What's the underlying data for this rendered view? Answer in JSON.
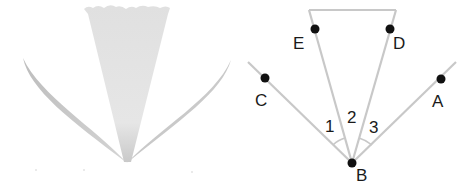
{
  "figure": {
    "left_illustration": {
      "description": "fan of three shaded leaf/cone shapes meeting at a point",
      "colors": {
        "cone": "#d9d9d9",
        "leaf": "#c4c4c4"
      }
    },
    "right_diagram": {
      "points": [
        {
          "name": "E",
          "label": "E"
        },
        {
          "name": "D",
          "label": "D"
        },
        {
          "name": "C",
          "label": "C"
        },
        {
          "name": "A",
          "label": "A"
        },
        {
          "name": "B",
          "label": "B"
        }
      ],
      "angles": [
        {
          "label": "1"
        },
        {
          "label": "2"
        },
        {
          "label": "3"
        }
      ],
      "colors": {
        "line": "#c8c8c8",
        "dot": "#111111",
        "text": "#1a1a1a"
      }
    }
  }
}
